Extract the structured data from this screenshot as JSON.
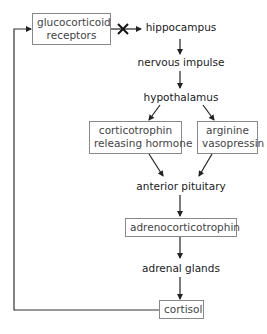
{
  "diagram": {
    "nodes": {
      "glucocorticoid_receptors": {
        "line1": "glucocorticoid",
        "line2": "receptors",
        "boxed": true
      },
      "hippocampus": {
        "label": "hippocampus",
        "boxed": false
      },
      "nervous_impulse": {
        "label": "nervous impulse",
        "boxed": false
      },
      "hypothalamus": {
        "label": "hypothalamus",
        "boxed": false
      },
      "crh": {
        "line1": "corticotrophin",
        "line2": "releasing hormone",
        "boxed": true
      },
      "avp": {
        "line1": "arginine",
        "line2": "vasopressin",
        "boxed": true
      },
      "anterior_pituitary": {
        "label": "anterior pituitary",
        "boxed": false
      },
      "acth": {
        "label": "adrenocorticotrophin",
        "boxed": true
      },
      "adrenal_glands": {
        "label": "adrenal glands",
        "boxed": false
      },
      "cortisol": {
        "label": "cortisol",
        "boxed": true
      }
    },
    "edges": [
      {
        "from": "glucocorticoid receptors",
        "to": "hippocampus",
        "blocked": true,
        "marker": "X"
      },
      {
        "from": "hippocampus",
        "to": "nervous impulse"
      },
      {
        "from": "nervous impulse",
        "to": "hypothalamus"
      },
      {
        "from": "hypothalamus",
        "to": "corticotrophin releasing hormone"
      },
      {
        "from": "hypothalamus",
        "to": "arginine vasopressin"
      },
      {
        "from": "corticotrophin releasing hormone",
        "to": "anterior pituitary"
      },
      {
        "from": "arginine vasopressin",
        "to": "anterior pituitary"
      },
      {
        "from": "anterior pituitary",
        "to": "adrenocorticotrophin"
      },
      {
        "from": "adrenocorticotrophin",
        "to": "adrenal glands"
      },
      {
        "from": "adrenal glands",
        "to": "cortisol"
      },
      {
        "from": "cortisol",
        "to": "glucocorticoid receptors",
        "type": "feedback"
      }
    ],
    "colors": {
      "line": "#222222",
      "box_border": "#888888",
      "text": "#222222"
    }
  }
}
